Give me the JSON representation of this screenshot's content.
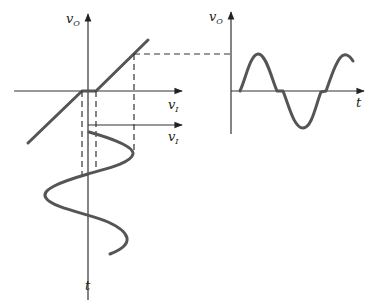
{
  "labels": {
    "left_vertical_axis": "v",
    "left_vertical_axis_sub": "O",
    "left_horizontal_axis": "v",
    "left_horizontal_axis_sub": "I",
    "input_axis": "v",
    "input_axis_sub": "I",
    "time_axis_down": "t",
    "right_vertical_axis": "v",
    "right_vertical_axis_sub": "O",
    "right_time_axis": "t"
  },
  "colors": {
    "curve": "#555555",
    "axis": "#333333"
  }
}
